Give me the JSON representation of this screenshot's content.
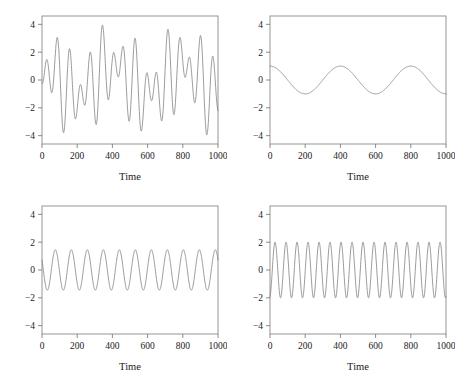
{
  "figure": {
    "layout": "2x2 grid of time series panels",
    "background_color": "#ffffff",
    "line_color": "#7a7a7a",
    "axis_color": "#8a8a8a"
  },
  "chart_data": [
    {
      "type": "line",
      "panel": "top-left",
      "title": "",
      "xlabel": "Time",
      "ylabel": "",
      "xlim": [
        0,
        1000
      ],
      "ylim": [
        -4.6,
        4.6
      ],
      "xticks": [
        0,
        200,
        400,
        600,
        800,
        1000
      ],
      "yticks": [
        -4,
        -2,
        0,
        2,
        4
      ],
      "xtick_labels": [
        "0",
        "200",
        "400",
        "600",
        "800",
        "1000"
      ],
      "ytick_labels": [
        "-4",
        "-2",
        "0",
        "2",
        "4"
      ],
      "grid": false,
      "legend": "none",
      "description": "Sum of three sinusoidal components",
      "components": [
        {
          "amplitude": 1.0,
          "period": 400,
          "phase_deg": 0
        },
        {
          "amplitude": 1.45,
          "period": 90.9,
          "phase_deg": 60
        },
        {
          "amplitude": 2.0,
          "period": 62.5,
          "phase_deg": 195
        }
      ],
      "n_points": 1000,
      "observed_max": 4.1,
      "observed_min": -4.1
    },
    {
      "type": "line",
      "panel": "top-right",
      "title": "",
      "xlabel": "Time",
      "ylabel": "",
      "xlim": [
        0,
        1000
      ],
      "ylim": [
        -4.6,
        4.6
      ],
      "xticks": [
        0,
        200,
        400,
        600,
        800,
        1000
      ],
      "yticks": [
        -4,
        -2,
        0,
        2,
        4
      ],
      "xtick_labels": [
        "0",
        "200",
        "400",
        "600",
        "800",
        "1000"
      ],
      "ytick_labels": [
        "-4",
        "-2",
        "0",
        "2",
        "4"
      ],
      "grid": false,
      "legend": "none",
      "description": "Slow cosine component",
      "components": [
        {
          "amplitude": 1.0,
          "period": 400,
          "phase_deg": 0
        }
      ],
      "n_points": 1000,
      "observed_max": 1.0,
      "observed_min": -1.0
    },
    {
      "type": "line",
      "panel": "bottom-left",
      "title": "",
      "xlabel": "Time",
      "ylabel": "",
      "xlim": [
        0,
        1000
      ],
      "ylim": [
        -4.6,
        4.6
      ],
      "xticks": [
        0,
        200,
        400,
        600,
        800,
        1000
      ],
      "yticks": [
        -4,
        -2,
        0,
        2,
        4
      ],
      "xtick_labels": [
        "0",
        "200",
        "400",
        "600",
        "800",
        "1000"
      ],
      "ytick_labels": [
        "-4",
        "-2",
        "0",
        "2",
        "4"
      ],
      "grid": false,
      "legend": "none",
      "description": "Medium frequency sinusoid, 11 cycles",
      "components": [
        {
          "amplitude": 1.45,
          "period": 90.9,
          "phase_deg": 60
        }
      ],
      "n_points": 1000,
      "observed_max": 1.45,
      "observed_min": -1.45
    },
    {
      "type": "line",
      "panel": "bottom-right",
      "title": "",
      "xlabel": "Time",
      "ylabel": "",
      "xlim": [
        0,
        1000
      ],
      "ylim": [
        -4.6,
        4.6
      ],
      "xticks": [
        0,
        200,
        400,
        600,
        800,
        1000
      ],
      "yticks": [
        -4,
        -2,
        0,
        2,
        4
      ],
      "xtick_labels": [
        "0",
        "200",
        "400",
        "600",
        "800",
        "1000"
      ],
      "ytick_labels": [
        "-4",
        "-2",
        "0",
        "2",
        "4"
      ],
      "grid": false,
      "legend": "none",
      "description": "High frequency sinusoid, 16 cycles",
      "components": [
        {
          "amplitude": 2.0,
          "period": 62.5,
          "phase_deg": 195
        }
      ],
      "n_points": 1000,
      "observed_max": 2.0,
      "observed_min": -2.0
    }
  ]
}
